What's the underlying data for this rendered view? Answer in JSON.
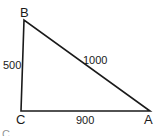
{
  "diagram": {
    "type": "right-triangle",
    "vertices": [
      {
        "name": "B",
        "label": "B"
      },
      {
        "name": "C",
        "label": "C"
      },
      {
        "name": "A",
        "label": "A"
      }
    ],
    "sides": {
      "BC": "500",
      "AB": "1000",
      "CA": "900"
    },
    "caption_fragment": "C"
  },
  "colors": {
    "stroke": "#1a1a1a",
    "background": "#ffffff"
  }
}
